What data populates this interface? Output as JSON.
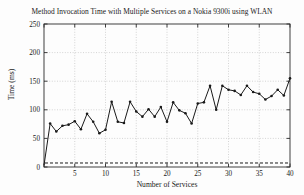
{
  "chart_data": {
    "type": "line",
    "title": "Method Invocation Time with Multiple Services on a Nokia 9300i using WLAN",
    "xlabel": "Number of Services",
    "ylabel": "Time (ms)",
    "xlim": [
      0,
      40
    ],
    "ylim": [
      0,
      250
    ],
    "xticks": [
      0,
      5,
      10,
      15,
      20,
      25,
      30,
      35,
      40
    ],
    "yticks": [
      0,
      50,
      100,
      150,
      200,
      250
    ],
    "grid": true,
    "legend": null,
    "marker": "dot",
    "line_color": "#1a1a1a",
    "x": [
      0,
      1,
      2,
      3,
      4,
      5,
      6,
      7,
      8,
      9,
      10,
      11,
      12,
      13,
      14,
      15,
      16,
      17,
      18,
      19,
      20,
      21,
      22,
      23,
      24,
      25,
      26,
      27,
      28,
      29,
      30,
      31,
      32,
      33,
      34,
      35,
      36,
      37,
      38,
      39,
      40
    ],
    "values": [
      3,
      76,
      62,
      72,
      74,
      80,
      66,
      93,
      79,
      59,
      65,
      114,
      79,
      77,
      114,
      97,
      88,
      101,
      88,
      105,
      79,
      113,
      99,
      94,
      76,
      111,
      113,
      142,
      100,
      142,
      135,
      133,
      126,
      142,
      131,
      128,
      118,
      124,
      135,
      125,
      155
    ],
    "series": [
      {
        "name": "Method invocation time",
        "values": [
          3,
          76,
          62,
          72,
          74,
          80,
          66,
          93,
          79,
          59,
          65,
          114,
          79,
          77,
          114,
          97,
          88,
          101,
          88,
          105,
          79,
          113,
          99,
          94,
          76,
          111,
          113,
          142,
          100,
          142,
          135,
          133,
          126,
          142,
          131,
          128,
          118,
          124,
          135,
          125,
          155
        ]
      }
    ],
    "reference_line": {
      "name": "baseline",
      "style": "dashed",
      "value": 7,
      "color": "#1a1a1a"
    },
    "xtick_labels": [
      "0",
      "5",
      "10",
      "15",
      "20",
      "25",
      "30",
      "35",
      "40"
    ],
    "ytick_labels": [
      "0",
      "50",
      "100",
      "150",
      "200",
      "250"
    ]
  }
}
